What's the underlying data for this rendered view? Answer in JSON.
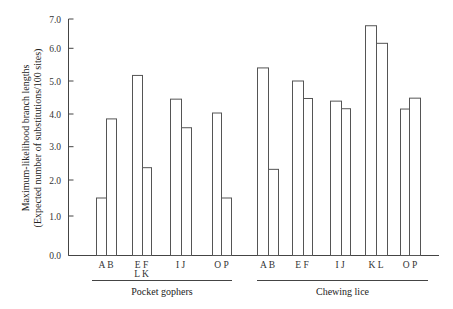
{
  "chart_data": {
    "type": "bar",
    "title": "",
    "ylabel": "Maximum-likelihood branch lengths",
    "ylabel_sub": "(Expected number of substitutions/100 sites)",
    "xlabel": "",
    "ylim": [
      0,
      7
    ],
    "yticks": [
      "0.0",
      "1.0",
      "2.0",
      "3.0",
      "4.0",
      "5.0",
      "6.0",
      "7.0"
    ],
    "grid": false,
    "legend": null,
    "groups": [
      {
        "name": "Pocket gophers",
        "pairs": [
          {
            "label": "A B",
            "label2": "",
            "bars": [
              {
                "name": "A",
                "value": 1.5
              },
              {
                "name": "B",
                "value": 3.85
              }
            ]
          },
          {
            "label": "E F",
            "label2": "L K",
            "bars": [
              {
                "name": "E",
                "value": 5.17
              },
              {
                "name": "F",
                "value": 2.37
              }
            ]
          },
          {
            "label": "I J",
            "label2": "",
            "bars": [
              {
                "name": "I",
                "value": 4.45
              },
              {
                "name": "J",
                "value": 3.58
              }
            ]
          },
          {
            "label": "O P",
            "label2": "",
            "bars": [
              {
                "name": "O",
                "value": 4.03
              },
              {
                "name": "P",
                "value": 1.5
              }
            ]
          }
        ]
      },
      {
        "name": "Chewing lice",
        "pairs": [
          {
            "label": "A B",
            "label2": "",
            "bars": [
              {
                "name": "A",
                "value": 5.4
              },
              {
                "name": "B",
                "value": 2.32
              }
            ]
          },
          {
            "label": "E F",
            "label2": "",
            "bars": [
              {
                "name": "E",
                "value": 5.0
              },
              {
                "name": "F",
                "value": 4.47
              }
            ]
          },
          {
            "label": "I J",
            "label2": "",
            "bars": [
              {
                "name": "I",
                "value": 4.39
              },
              {
                "name": "J",
                "value": 4.16
              }
            ]
          },
          {
            "label": "K L",
            "label2": "",
            "bars": [
              {
                "name": "K",
                "value": 6.77
              },
              {
                "name": "L",
                "value": 6.17
              }
            ]
          },
          {
            "label": "O P",
            "label2": "",
            "bars": [
              {
                "name": "O",
                "value": 4.15
              },
              {
                "name": "P",
                "value": 4.48
              }
            ]
          }
        ]
      }
    ],
    "categories": [
      "Pocket gophers A",
      "Pocket gophers B",
      "Pocket gophers E",
      "Pocket gophers F",
      "Pocket gophers I",
      "Pocket gophers J",
      "Pocket gophers O",
      "Pocket gophers P",
      "Chewing lice A",
      "Chewing lice B",
      "Chewing lice E",
      "Chewing lice F",
      "Chewing lice I",
      "Chewing lice J",
      "Chewing lice K",
      "Chewing lice L",
      "Chewing lice O",
      "Chewing lice P"
    ],
    "values": [
      1.5,
      3.85,
      5.17,
      2.37,
      4.45,
      3.58,
      4.03,
      1.5,
      5.4,
      2.32,
      5.0,
      4.47,
      4.39,
      4.16,
      6.77,
      6.17,
      4.15,
      4.48
    ]
  },
  "layout": {
    "pair_x": [
      [
        96,
        106,
        116
      ],
      [
        132,
        142,
        151
      ],
      [
        170,
        181,
        191
      ],
      [
        212,
        221,
        231
      ],
      [
        257,
        268,
        278
      ],
      [
        292,
        303,
        312
      ],
      [
        330,
        341,
        350
      ],
      [
        365,
        376,
        387
      ],
      [
        400,
        409,
        420
      ]
    ],
    "group_underline": [
      [
        92,
        232
      ],
      [
        257,
        428
      ]
    ]
  }
}
